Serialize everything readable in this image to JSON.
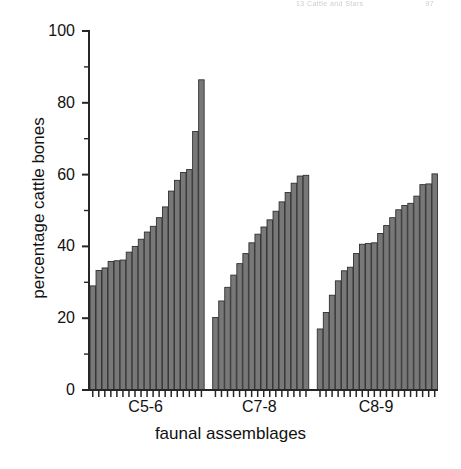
{
  "page_header": {
    "text_fragment": "13  Cattle and Stars",
    "page_number": "97",
    "legible": false
  },
  "chart_data": {
    "type": "bar",
    "title": "",
    "subtitle": "",
    "xlabel": "faunal assemblages",
    "ylabel": "percentage cattle bones",
    "ylim": [
      0,
      100
    ],
    "ytick_values": [
      0,
      20,
      40,
      60,
      80,
      100
    ],
    "ytick_labels": [
      "0",
      "20",
      "40",
      "60",
      "80",
      "100"
    ],
    "yminor_tick_values": [
      10,
      30,
      50,
      70,
      90
    ],
    "grid": false,
    "legend": null,
    "legend_position": "none",
    "bar_color": "#787878",
    "bar_edge_color": "#303030",
    "axis_color": "#262626",
    "categories": [
      "C5-6",
      "C7-8",
      "C8-9"
    ],
    "groups": [
      {
        "name": "C5-6",
        "label": "C5-6",
        "values": [
          29.0,
          33.3,
          34.0,
          35.8,
          36.0,
          36.2,
          38.4,
          40.0,
          42.0,
          44.0,
          45.6,
          48.0,
          51.0,
          55.4,
          58.4,
          60.6,
          61.4,
          72.0,
          86.4
        ]
      },
      {
        "name": "C7-8",
        "label": "C7-8",
        "values": [
          20.2,
          24.8,
          28.6,
          32.0,
          35.2,
          38.0,
          41.0,
          43.4,
          45.4,
          47.4,
          49.8,
          52.4,
          55.0,
          57.6,
          59.6,
          59.8
        ]
      },
      {
        "name": "C8-9",
        "label": "C8-9",
        "values": [
          17.0,
          21.6,
          26.4,
          30.4,
          33.2,
          34.2,
          38.0,
          40.6,
          40.8,
          41.0,
          43.6,
          45.8,
          48.0,
          50.2,
          51.4,
          52.0,
          54.0,
          57.2,
          57.4,
          60.2
        ]
      }
    ]
  }
}
